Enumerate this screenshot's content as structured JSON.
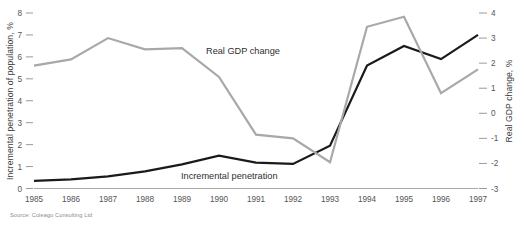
{
  "source_note": "Source: Coleago Consulting Ltd",
  "chart_data": {
    "type": "line",
    "title": "",
    "subtitle": "",
    "xlabel": "",
    "ylabel": "Incremental penetration of population, %",
    "y2label": "Real GDP change, %",
    "grid": false,
    "legend_position": "inline-annotation",
    "categories": [
      "1985",
      "1986",
      "1987",
      "1988",
      "1989",
      "1990",
      "1991",
      "1992",
      "1993",
      "1994",
      "1995",
      "1996",
      "1997"
    ],
    "x": [
      1985,
      1986,
      1987,
      1988,
      1989,
      1990,
      1991,
      1992,
      1993,
      1994,
      1995,
      1996,
      1997
    ],
    "ylim": [
      0,
      8
    ],
    "yticks": [
      "0",
      "1",
      "2",
      "3",
      "4",
      "5",
      "6",
      "7",
      "8"
    ],
    "ytick_values": [
      0,
      1,
      2,
      3,
      4,
      5,
      6,
      7,
      8
    ],
    "y2lim": [
      -3,
      4
    ],
    "y2ticks": [
      "-3",
      "-2",
      "-1",
      "0",
      "1",
      "2",
      "3",
      "4"
    ],
    "y2tick_values": [
      -3,
      -2,
      -1,
      0,
      1,
      2,
      3,
      4
    ],
    "series": [
      {
        "name": "Incremental penetration",
        "axis": "left",
        "color": "#1a1a1a",
        "stroke_width": 2.2,
        "label_text": "Incremental penetration",
        "values": [
          0.35,
          0.42,
          0.55,
          0.78,
          1.1,
          1.5,
          1.18,
          1.12,
          1.95,
          5.6,
          6.5,
          5.9,
          7.0
        ]
      },
      {
        "name": "Real GDP change",
        "axis": "right",
        "color": "#a8a8a8",
        "stroke_width": 2.2,
        "label_text": "Real GDP change",
        "values": [
          1.9,
          2.15,
          3.0,
          2.55,
          2.6,
          1.45,
          -0.85,
          -1.0,
          -1.95,
          3.45,
          3.85,
          0.8,
          1.75
        ]
      }
    ],
    "annotations": [
      {
        "text": "Real GDP change",
        "x": 206,
        "y": 54
      },
      {
        "text": "Incremental penetration",
        "x": 181,
        "y": 179
      }
    ]
  }
}
